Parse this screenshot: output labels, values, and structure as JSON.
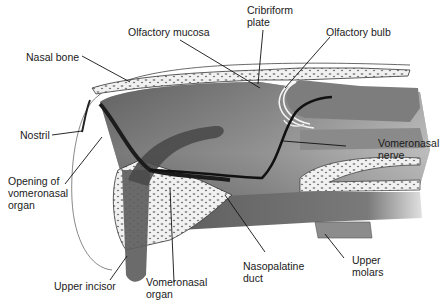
{
  "diagram": {
    "labels": {
      "olfactory_mucosa": "Olfactory mucosa",
      "cribriform_plate": "Cribriform\nplate",
      "olfactory_bulb": "Olfactory bulb",
      "nasal_bone": "Nasal bone",
      "nostril": "Nostril",
      "vomeronasal_nerve": "Vomeronasal\nnerve",
      "opening_vno": "Opening of\nvomeronasal\norgan",
      "upper_incisor": "Upper incisor",
      "vomeronasal_organ": "Vomeronasal\norgan",
      "nasopalatine_duct": "Nasopalatine\nduct",
      "upper_molars": "Upper\nmolars"
    },
    "colors": {
      "tissue_dark": "#3a3a3a",
      "tissue_mid": "#7a7a7a",
      "tissue_light": "#b8b8b8",
      "bone": "#f2f2f2",
      "line": "#111111"
    }
  }
}
